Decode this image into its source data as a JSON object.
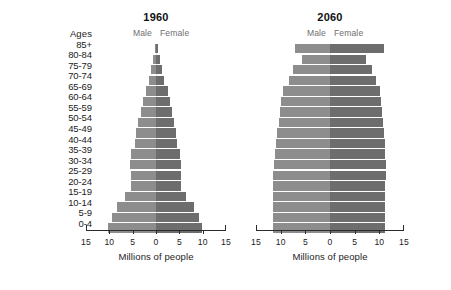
{
  "ages_header": "Ages",
  "age_groups": [
    "85+",
    "80-84",
    "75-79",
    "70-74",
    "65-69",
    "60-64",
    "55-59",
    "50-54",
    "45-49",
    "40-44",
    "35-39",
    "30-34",
    "25-29",
    "20-24",
    "15-19",
    "10-14",
    "5-9",
    "0-4"
  ],
  "male_label": "Male",
  "female_label": "Female",
  "axis_title": "Millions of people",
  "axis_ticks": [
    "15",
    "10",
    "5",
    "0",
    "5",
    "10",
    "15"
  ],
  "colors": {
    "male_bar": "#8d8d8d",
    "female_bar": "#6d6d6d",
    "axis": "#2b2b2b",
    "text": "#1c1c1c",
    "sex_label": "#6f6f6f",
    "background": "#ffffff"
  },
  "panels": [
    {
      "title": "1960"
    },
    {
      "title": "2060"
    }
  ],
  "chart_data": [
    {
      "type": "bar",
      "title": "1960",
      "subtitle": "Population pyramid, United States",
      "orientation": "horizontal-diverging",
      "xlabel": "Millions of people",
      "ylabel": "Ages",
      "xlim": [
        -15,
        15
      ],
      "xticks": [
        -15,
        -10,
        -5,
        0,
        5,
        10,
        15
      ],
      "xticklabels": [
        "15",
        "10",
        "5",
        "0",
        "5",
        "10",
        "15"
      ],
      "grid": false,
      "legend_position": "top-inline",
      "categories": [
        "85+",
        "80-84",
        "75-79",
        "70-74",
        "65-69",
        "60-64",
        "55-59",
        "50-54",
        "45-49",
        "40-44",
        "35-39",
        "30-34",
        "25-29",
        "20-24",
        "15-19",
        "10-14",
        "5-9",
        "0-4"
      ],
      "series": [
        {
          "name": "Male",
          "side": "left",
          "values": [
            0.3,
            0.6,
            1.0,
            1.5,
            2.2,
            2.8,
            3.3,
            3.8,
            4.2,
            4.6,
            5.3,
            5.5,
            5.3,
            5.3,
            6.6,
            8.4,
            9.5,
            10.2
          ]
        },
        {
          "name": "Female",
          "side": "right",
          "values": [
            0.5,
            0.9,
            1.3,
            1.8,
            2.5,
            3.0,
            3.5,
            3.9,
            4.3,
            4.6,
            5.2,
            5.4,
            5.3,
            5.4,
            6.5,
            8.1,
            9.2,
            9.8
          ]
        }
      ]
    },
    {
      "type": "bar",
      "title": "2060",
      "subtitle": "Population pyramid projection, United States",
      "orientation": "horizontal-diverging",
      "xlabel": "Millions of people",
      "ylabel": "Ages",
      "xlim": [
        -15,
        15
      ],
      "xticks": [
        -15,
        -10,
        -5,
        0,
        5,
        10,
        15
      ],
      "xticklabels": [
        "15",
        "10",
        "5",
        "0",
        "5",
        "10",
        "15"
      ],
      "grid": false,
      "legend_position": "top-inline",
      "categories": [
        "85+",
        "80-84",
        "75-79",
        "70-74",
        "65-69",
        "60-64",
        "55-59",
        "50-54",
        "45-49",
        "40-44",
        "35-39",
        "30-34",
        "25-29",
        "20-24",
        "15-19",
        "10-14",
        "5-9",
        "0-4"
      ],
      "series": [
        {
          "name": "Male",
          "side": "left",
          "values": [
            7.0,
            5.6,
            7.5,
            8.4,
            9.6,
            10.0,
            10.2,
            10.4,
            10.7,
            11.0,
            11.1,
            11.4,
            11.5,
            11.5,
            11.5,
            11.6,
            11.6,
            11.6
          ]
        },
        {
          "name": "Female",
          "side": "right",
          "values": [
            10.9,
            7.3,
            8.6,
            9.3,
            10.2,
            10.4,
            10.5,
            10.7,
            10.9,
            11.1,
            11.2,
            11.3,
            11.3,
            11.2,
            11.1,
            11.1,
            11.2,
            11.2
          ]
        }
      ]
    }
  ]
}
